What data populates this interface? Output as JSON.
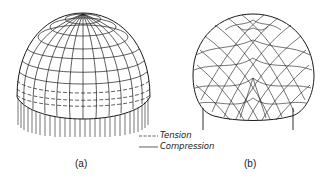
{
  "figure": {
    "panels": [
      {
        "id": "a",
        "label": "(a)",
        "description": "Hemispherical dome with meridian and parallel lines, continuous edge supports (arrows)"
      },
      {
        "id": "b",
        "label": "(b)",
        "description": "Dome on discrete point supports showing stress trajectory lines"
      }
    ],
    "legend": {
      "items": [
        {
          "style": "dashed",
          "label": "Tension"
        },
        {
          "style": "solid",
          "label": "Compression"
        }
      ]
    },
    "colors": {
      "line": "#1a1a1a",
      "background": "#ffffff"
    }
  }
}
